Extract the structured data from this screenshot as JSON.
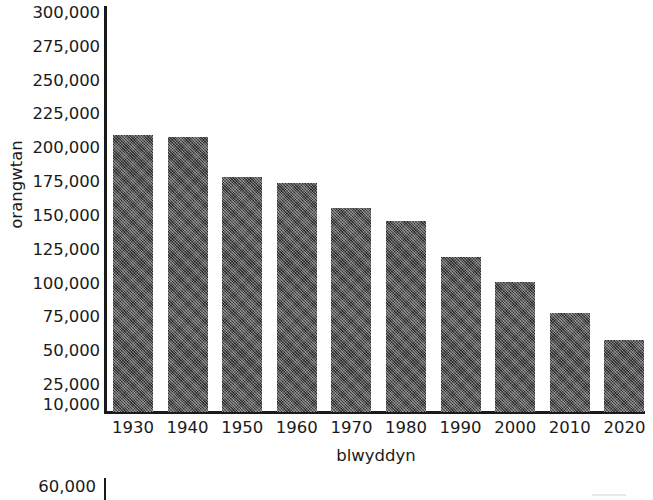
{
  "chart_data": {
    "type": "bar",
    "title": "",
    "subtitle": "",
    "xlabel": "blwyddyn",
    "ylabel": "orangwtan",
    "categories": [
      "1930",
      "1940",
      "1950",
      "1960",
      "1970",
      "1980",
      "1990",
      "2000",
      "2010",
      "2020"
    ],
    "values": [
      210000,
      208000,
      179000,
      174000,
      156000,
      146000,
      120000,
      101000,
      78000,
      58000
    ],
    "ylim": [
      10000,
      300000
    ],
    "y_tick_labels": [
      "300,000",
      "275,000",
      "250,000",
      "225,000",
      "200,000",
      "175,000",
      "150,000",
      "125,000",
      "100,000",
      "75,000",
      "50,000",
      "25,000",
      "10,000"
    ],
    "y_tick_values": [
      300000,
      275000,
      250000,
      225000,
      200000,
      175000,
      150000,
      125000,
      100000,
      75000,
      50000,
      25000,
      10000
    ],
    "x_tick_labels": [
      "1930",
      "1940",
      "1950",
      "1960",
      "1970",
      "1980",
      "1990",
      "2000",
      "2010",
      "2020"
    ],
    "grid": false,
    "legend": false,
    "legend_position": "none",
    "bar_color": "#3f3f3f",
    "bar_fill": "dithered-crosshatch",
    "axis_color": "#1a1a1a",
    "background_color": "#ffffff"
  },
  "secondary_figure": {
    "y_tick_label": "60,000",
    "note": "partially visible chart cropped at bottom edge"
  }
}
